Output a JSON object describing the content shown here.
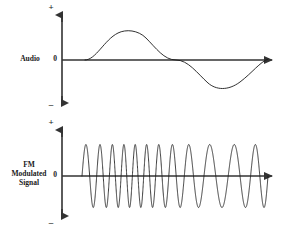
{
  "figure": {
    "title_visible": false,
    "background_color": "#ffffff",
    "stroke_color": "#1a1a1a",
    "axis_color": "#333333"
  },
  "panels": [
    {
      "id": "audio",
      "label": "Audio",
      "axis": {
        "zero_label": "0",
        "plus_label": "+",
        "minus_label": "–"
      }
    },
    {
      "id": "fm",
      "label": "FM\nModulated\nSignal",
      "axis": {
        "zero_label": "0",
        "plus_label": "+",
        "minus_label": "–"
      }
    }
  ],
  "chart_data": [
    {
      "type": "line",
      "id": "audio-waveform",
      "title": "Audio",
      "xlabel": "",
      "ylabel": "Audio",
      "grid": false,
      "legend": "none",
      "xlim": [
        0,
        1
      ],
      "ylim": [
        -1,
        1
      ],
      "y_tick_labels": [
        "+",
        "0",
        "–"
      ],
      "description": "One cycle of a sine wave: positive half-cycle then negative half-cycle",
      "series": [
        {
          "name": "audio",
          "waveform": "sine",
          "cycles": 1,
          "amplitude": 1.0,
          "phase_deg": 0,
          "x_start_px": 85,
          "x_end_px": 268,
          "peak_px": {
            "x": 132,
            "y": 32
          },
          "trough_px": {
            "x": 216,
            "y": 88
          },
          "zero_crossings_px": [
            85,
            176,
            268
          ]
        }
      ]
    },
    {
      "type": "line",
      "id": "fm-waveform",
      "title": "FM Modulated Signal",
      "xlabel": "",
      "ylabel": "FM Modulated Signal",
      "grid": false,
      "legend": "none",
      "xlim": [
        0,
        1
      ],
      "ylim": [
        -1,
        1
      ],
      "y_tick_labels": [
        "+",
        "0",
        "–"
      ],
      "description": "Constant-amplitude carrier whose instantaneous frequency follows the audio signal: frequency is highest where the audio peaks and lowest where the audio troughs",
      "series": [
        {
          "name": "fm",
          "waveform": "frequency-modulated carrier",
          "amplitude": 1.0,
          "amplitude_constant": true,
          "carrier_cycles_visible": 12,
          "x_start_px": 82,
          "x_end_px": 268,
          "top_px": 145,
          "bottom_px": 208,
          "center_px": 176,
          "positive_peak_x_px": [
            88,
            110,
            122,
            128,
            133,
            138,
            145,
            158,
            176,
            196,
            218,
            240,
            259
          ],
          "frequency_profile": {
            "min_relative": 0.45,
            "max_relative": 1.0,
            "densest_region_px": [
              120,
              142
            ],
            "sparsest_region_px": [
              190,
              230
            ]
          }
        }
      ]
    }
  ]
}
